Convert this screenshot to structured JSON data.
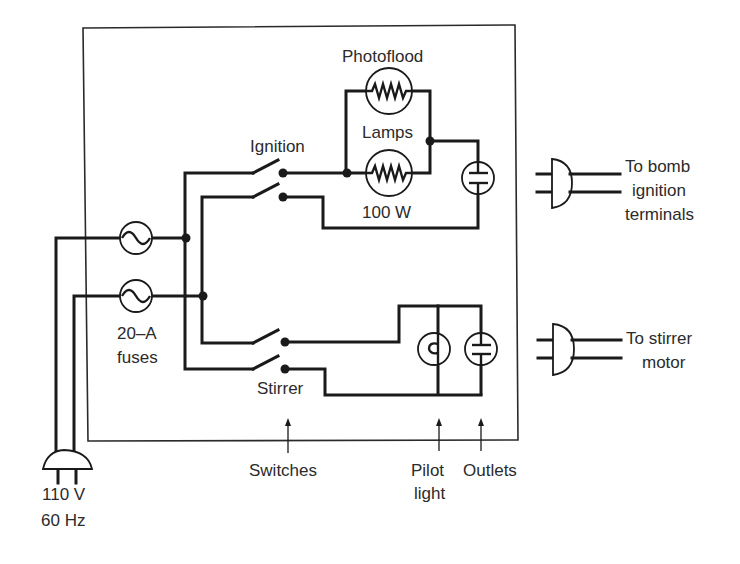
{
  "figure": {
    "type": "electrical wiring schematic"
  },
  "labels": {
    "photoflood": "Photoflood",
    "lamps": "Lamps",
    "watt": "100 W",
    "ignition": "Ignition",
    "stirrer": "Stirrer",
    "fuse_rating": "20–A",
    "fuses": "fuses",
    "voltage": "110 V",
    "frequency": "60 Hz",
    "to_bomb_1": "To bomb",
    "to_bomb_2": "ignition",
    "to_bomb_3": "terminals",
    "to_stirrer_1": "To stirrer",
    "to_stirrer_2": "motor",
    "switches": "Switches",
    "pilot_1": "Pilot",
    "pilot_2": "light",
    "outlets": "Outlets"
  },
  "components": [
    {
      "name": "enclosure-box",
      "kind": "box"
    },
    {
      "name": "fuse-1",
      "kind": "fuse",
      "group": "20-A fuses"
    },
    {
      "name": "fuse-2",
      "kind": "fuse",
      "group": "20-A fuses"
    },
    {
      "name": "ignition-switch",
      "kind": "DPST switch",
      "label": "Ignition"
    },
    {
      "name": "stirrer-switch",
      "kind": "DPST switch",
      "label": "Stirrer"
    },
    {
      "name": "photoflood-lamp-1",
      "kind": "lamp",
      "rating": "100 W"
    },
    {
      "name": "photoflood-lamp-2",
      "kind": "lamp",
      "rating": "100 W"
    },
    {
      "name": "ignition-outlet",
      "kind": "outlet"
    },
    {
      "name": "pilot-light",
      "kind": "pilot lamp"
    },
    {
      "name": "stirrer-outlet",
      "kind": "outlet"
    },
    {
      "name": "bomb-ignition-plug",
      "kind": "plug",
      "label": "To bomb ignition terminals"
    },
    {
      "name": "stirrer-motor-plug",
      "kind": "plug",
      "label": "To stirrer motor"
    },
    {
      "name": "mains-plug",
      "kind": "plug",
      "label": "110 V 60 Hz"
    }
  ]
}
